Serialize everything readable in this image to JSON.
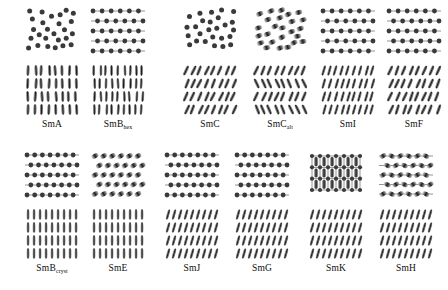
{
  "figure": {
    "ink_color": "#2e2e2e",
    "bond_color": "#4a4a4a",
    "background": "#ffffff"
  },
  "blocks": [
    {
      "name": "block-top-left",
      "x": 18,
      "y": 6,
      "panels": [
        0,
        1
      ]
    },
    {
      "name": "block-top-right",
      "x": 178,
      "y": 6,
      "panels": [
        2,
        3,
        4,
        5
      ]
    },
    {
      "name": "block-bottom-left",
      "x": 18,
      "y": 150,
      "panels": [
        6,
        7
      ]
    },
    {
      "name": "block-bottom-right",
      "x": 160,
      "y": 150,
      "panels": [
        8,
        9,
        10,
        11
      ]
    }
  ],
  "panels": [
    {
      "id": "sma",
      "label_main": "SmA",
      "label_sub": "",
      "x": 22,
      "y": 6,
      "top": {
        "lattice": "random",
        "order": "liquid-like",
        "marker": "circle",
        "cols": 6,
        "rows": 5,
        "tilt": 0,
        "bonds": false
      },
      "side": {
        "tilt": 0,
        "jitter": 9,
        "alternating": false,
        "cols": 8,
        "rows": 4
      }
    },
    {
      "id": "smb-hex",
      "label_main": "SmB",
      "label_sub": "hex",
      "x": 88,
      "y": 6,
      "top": {
        "lattice": "hexagonal",
        "order": "hexatic bond-orientational",
        "marker": "circle",
        "cols": 6,
        "rows": 5,
        "tilt": 0,
        "bonds": true
      },
      "side": {
        "tilt": 0,
        "jitter": 7,
        "alternating": false,
        "cols": 9,
        "rows": 4
      }
    },
    {
      "id": "smc",
      "label_main": "SmC",
      "label_sub": "",
      "x": 180,
      "y": 6,
      "top": {
        "lattice": "random",
        "order": "liquid-like",
        "marker": "circle",
        "cols": 6,
        "rows": 5,
        "tilt": 0,
        "bonds": false
      },
      "side": {
        "tilt": 24,
        "jitter": 8,
        "alternating": false,
        "cols": 8,
        "rows": 4
      }
    },
    {
      "id": "smc-alt",
      "label_main": "SmC",
      "label_sub": "alt",
      "x": 250,
      "y": 6,
      "top": {
        "lattice": "random",
        "order": "liquid-like",
        "marker": "ellipse",
        "cols": 6,
        "rows": 5,
        "tilt": 28,
        "bonds": false
      },
      "side": {
        "tilt": 24,
        "jitter": 6,
        "alternating": true,
        "cols": 8,
        "rows": 4
      }
    },
    {
      "id": "smi",
      "label_main": "SmI",
      "label_sub": "",
      "x": 318,
      "y": 6,
      "top": {
        "lattice": "hexagonal",
        "order": "hexatic, tilt to apex",
        "marker": "circle",
        "cols": 6,
        "rows": 5,
        "tilt": 0,
        "bonds": true
      },
      "side": {
        "tilt": 16,
        "jitter": 2,
        "alternating": false,
        "cols": 9,
        "rows": 4
      }
    },
    {
      "id": "smf",
      "label_main": "SmF",
      "label_sub": "",
      "x": 384,
      "y": 6,
      "top": {
        "lattice": "hexagonal",
        "order": "hexatic, tilt to side",
        "marker": "circle",
        "cols": 6,
        "rows": 5,
        "tilt": 0,
        "bonds": true
      },
      "side": {
        "tilt": 22,
        "jitter": 9,
        "alternating": false,
        "cols": 8,
        "rows": 4
      }
    },
    {
      "id": "smb-cryst",
      "label_main": "SmB",
      "label_sub": "cryst",
      "x": 22,
      "y": 150,
      "top": {
        "lattice": "hexagonal",
        "order": "crystalline long-range",
        "marker": "circle",
        "cols": 7,
        "rows": 5,
        "tilt": 0,
        "bonds": true
      },
      "side": {
        "tilt": 0,
        "jitter": 0,
        "alternating": false,
        "cols": 9,
        "rows": 4
      }
    },
    {
      "id": "sme",
      "label_main": "SmE",
      "label_sub": "",
      "x": 88,
      "y": 150,
      "top": {
        "lattice": "herringbone",
        "order": "crystalline herringbone",
        "marker": "ellipse",
        "cols": 6,
        "rows": 5,
        "tilt": 30,
        "bonds": false
      },
      "side": {
        "tilt": 0,
        "jitter": 0,
        "alternating": false,
        "cols": 9,
        "rows": 4
      }
    },
    {
      "id": "smj",
      "label_main": "SmJ",
      "label_sub": "",
      "x": 162,
      "y": 150,
      "top": {
        "lattice": "hexagonal",
        "order": "crystalline, tilt to apex",
        "marker": "circle",
        "cols": 7,
        "rows": 5,
        "tilt": 0,
        "bonds": true
      },
      "side": {
        "tilt": 16,
        "jitter": 0,
        "alternating": false,
        "cols": 9,
        "rows": 4
      }
    },
    {
      "id": "smg",
      "label_main": "SmG",
      "label_sub": "",
      "x": 232,
      "y": 150,
      "top": {
        "lattice": "hexagonal",
        "order": "crystalline, tilt to side",
        "marker": "circle",
        "cols": 7,
        "rows": 5,
        "tilt": 0,
        "bonds": true
      },
      "side": {
        "tilt": 16,
        "jitter": 0,
        "alternating": false,
        "cols": 9,
        "rows": 4
      }
    },
    {
      "id": "smk",
      "label_main": "SmK",
      "label_sub": "",
      "x": 306,
      "y": 150,
      "top": {
        "lattice": "rectangular",
        "order": "crystalline herringbone, tilt to apex",
        "marker": "ellipse",
        "cols": 6,
        "rows": 3,
        "tilt": 0,
        "bonds": true
      },
      "side": {
        "tilt": 16,
        "jitter": 0,
        "alternating": false,
        "cols": 9,
        "rows": 4
      }
    },
    {
      "id": "smh",
      "label_main": "SmH",
      "label_sub": "",
      "x": 376,
      "y": 150,
      "top": {
        "lattice": "herringbone-lattice",
        "order": "crystalline herringbone, tilt to side",
        "marker": "ellipse",
        "cols": 6,
        "rows": 5,
        "tilt": 35,
        "bonds": true
      },
      "side": {
        "tilt": 16,
        "jitter": 0,
        "alternating": false,
        "cols": 9,
        "rows": 4
      }
    }
  ],
  "geometry": {
    "top_width": 58,
    "top_height": 52,
    "side_width": 60,
    "side_height": 52,
    "gap_between_views": 6,
    "caption_gap": 3
  }
}
